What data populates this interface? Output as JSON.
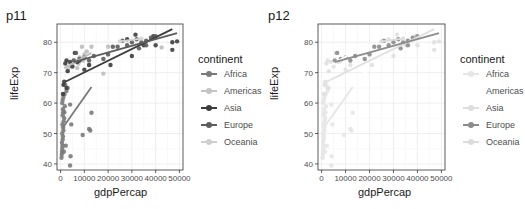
{
  "chart_data": [
    {
      "type": "scatter",
      "title": "p11",
      "xlabel": "gdpPercap",
      "ylabel": "lifeExp",
      "xlim": [
        -1500,
        51500
      ],
      "ylim": [
        38,
        86
      ],
      "xticks": [
        0,
        10000,
        20000,
        30000,
        40000,
        50000
      ],
      "xtick_labels": [
        "0",
        "10000",
        "20000",
        "30000",
        "40000",
        "50000"
      ],
      "yticks": [
        40,
        50,
        60,
        70,
        80
      ],
      "ytick_labels": [
        "40",
        "50",
        "60",
        "70",
        "80"
      ],
      "grid": true,
      "legend": {
        "title": "continent",
        "position": "right",
        "entries": [
          "Africa",
          "Americas",
          "Asia",
          "Europe",
          "Oceania"
        ]
      },
      "series": [
        {
          "name": "Africa",
          "color": "#7a7a7a",
          "points": [
            [
              400,
              42
            ],
            [
              500,
              43
            ],
            [
              600,
              44
            ],
            [
              700,
              45
            ],
            [
              800,
              46
            ],
            [
              600,
              47
            ],
            [
              900,
              48
            ],
            [
              1000,
              49
            ],
            [
              700,
              50
            ],
            [
              1200,
              51
            ],
            [
              1100,
              52
            ],
            [
              800,
              53
            ],
            [
              1300,
              54
            ],
            [
              1500,
              55
            ],
            [
              900,
              56
            ],
            [
              1600,
              57
            ],
            [
              1000,
              58
            ],
            [
              1800,
              59
            ],
            [
              700,
              60
            ],
            [
              1200,
              62
            ],
            [
              1700,
              63
            ],
            [
              2500,
              64
            ],
            [
              3000,
              65
            ],
            [
              2000,
              66
            ],
            [
              4000,
              59.5
            ],
            [
              4500,
              53
            ],
            [
              4200,
              42.5
            ],
            [
              4000,
              39.5
            ],
            [
              9300,
              49.5
            ],
            [
              12000,
              51.5
            ],
            [
              12500,
              51
            ],
            [
              13000,
              56.8
            ],
            [
              2200,
              46
            ],
            [
              1400,
              44
            ],
            [
              900,
              61
            ],
            [
              1100,
              57
            ]
          ],
          "trend": [
            [
              1000,
              52
            ],
            [
              13000,
              65.3
            ]
          ]
        },
        {
          "name": "Americas",
          "color": "#bdbdbd",
          "points": [
            [
              3000,
              71
            ],
            [
              4000,
              72
            ],
            [
              5000,
              73
            ],
            [
              6000,
              74
            ],
            [
              7000,
              71.5
            ],
            [
              8000,
              75
            ],
            [
              9000,
              78.5
            ],
            [
              10000,
              76
            ],
            [
              11000,
              77
            ],
            [
              13000,
              78.5
            ],
            [
              12000,
              72.5
            ],
            [
              18000,
              69.7
            ],
            [
              20000,
              78.5
            ],
            [
              7500,
              73
            ],
            [
              9500,
              74
            ],
            [
              42500,
              78.3
            ]
          ],
          "trend": [
            [
              1500,
              71.5
            ],
            [
              13000,
              76.5
            ]
          ]
        },
        {
          "name": "Asia",
          "color": "#3d3d3d",
          "points": [
            [
              1000,
              63
            ],
            [
              1500,
              67
            ],
            [
              2000,
              73
            ],
            [
              2500,
              74
            ],
            [
              3000,
              70.5
            ],
            [
              4000,
              73.5
            ],
            [
              5000,
              72
            ],
            [
              6000,
              76.5
            ],
            [
              7000,
              73.5
            ],
            [
              8000,
              74
            ],
            [
              10000,
              71
            ],
            [
              12000,
              72.5
            ],
            [
              21000,
              72.5
            ],
            [
              28000,
              81
            ],
            [
              30000,
              75.5
            ],
            [
              31500,
              82.5
            ],
            [
              35000,
              79
            ],
            [
              39000,
              82
            ],
            [
              40000,
              79
            ],
            [
              47000,
              80
            ],
            [
              47000,
              77.5
            ],
            [
              49000,
              80.3
            ],
            [
              2500,
              65
            ],
            [
              1200,
              66
            ]
          ],
          "trend": [
            [
              2000,
              67
            ],
            [
              47000,
              84.3
            ]
          ]
        },
        {
          "name": "Europe",
          "color": "#5c5c5c",
          "points": [
            [
              5500,
              74
            ],
            [
              6500,
              76.5
            ],
            [
              8000,
              74.5
            ],
            [
              10000,
              75
            ],
            [
              12000,
              74
            ],
            [
              14000,
              75.5
            ],
            [
              18000,
              74.5
            ],
            [
              20000,
              76
            ],
            [
              22000,
              78.5
            ],
            [
              24000,
              78.5
            ],
            [
              26000,
              80.5
            ],
            [
              28000,
              79
            ],
            [
              30000,
              80
            ],
            [
              32000,
              81
            ],
            [
              34000,
              80
            ],
            [
              36000,
              80.5
            ],
            [
              38000,
              81.5
            ],
            [
              40000,
              82
            ],
            [
              36000,
              79
            ],
            [
              33000,
              78
            ]
          ],
          "trend": [
            [
              5500,
              73.5
            ],
            [
              49000,
              83
            ]
          ]
        },
        {
          "name": "Oceania",
          "color": "#d4d4d4",
          "points": [
            [
              25000,
              80.3
            ],
            [
              34000,
              81.2
            ]
          ],
          "trend": [
            [
              25000,
              80.3
            ],
            [
              34000,
              81.2
            ]
          ]
        }
      ]
    },
    {
      "type": "scatter",
      "title": "p12",
      "xlabel": "gdpPercap",
      "ylabel": "lifeExp",
      "xlim": [
        -1500,
        51500
      ],
      "ylim": [
        38,
        86
      ],
      "xticks": [
        0,
        10000,
        20000,
        30000,
        40000,
        50000
      ],
      "xtick_labels": [
        "0",
        "10000",
        "20000",
        "30000",
        "40000",
        "50000"
      ],
      "yticks": [
        40,
        50,
        60,
        70,
        80
      ],
      "ytick_labels": [
        "40",
        "50",
        "60",
        "70",
        "80"
      ],
      "grid": true,
      "legend": {
        "title": "continent",
        "position": "right",
        "entries": [
          "Africa",
          "Americas",
          "Asia",
          "Europe",
          "Oceania"
        ]
      },
      "note": "Same data as p11; Europe highlighted in grey, other continents faded",
      "series": [
        {
          "name": "Africa",
          "color": "#e6e6e6"
        },
        {
          "name": "Americas",
          "color": "#ffffff"
        },
        {
          "name": "Asia",
          "color": "#e0e0e0"
        },
        {
          "name": "Europe",
          "color": "#8c8c8c"
        },
        {
          "name": "Oceania",
          "color": "#dcdcdc"
        }
      ]
    }
  ],
  "panels": [
    {
      "title": "p11",
      "xlabel": "gdpPercap",
      "ylabel": "lifeExp",
      "legend_title": "continent",
      "legend": [
        {
          "label": "Africa",
          "color": "#7a7a7a"
        },
        {
          "label": "Americas",
          "color": "#c4c4c4"
        },
        {
          "label": "Asia",
          "color": "#3d3d3d"
        },
        {
          "label": "Europe",
          "color": "#5c5c5c"
        },
        {
          "label": "Oceania",
          "color": "#cfcfcf"
        }
      ]
    },
    {
      "title": "p12",
      "xlabel": "gdpPercap",
      "ylabel": "lifeExp",
      "legend_title": "continent",
      "legend": [
        {
          "label": "Africa",
          "color": "#e6e6e6"
        },
        {
          "label": "Americas",
          "color": "#ffffff"
        },
        {
          "label": "Asia",
          "color": "#dedede"
        },
        {
          "label": "Europe",
          "color": "#8c8c8c"
        },
        {
          "label": "Oceania",
          "color": "#dcdcdc"
        }
      ]
    }
  ]
}
